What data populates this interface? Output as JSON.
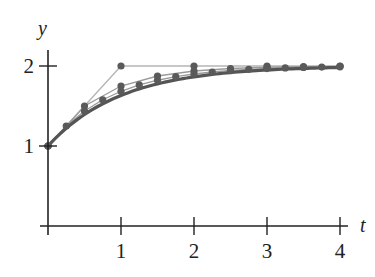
{
  "chart_data": {
    "type": "line",
    "title": "",
    "xlabel": "t",
    "ylabel": "y",
    "xlim": [
      0,
      4
    ],
    "ylim": [
      0,
      2
    ],
    "x_ticks": [
      1,
      2,
      3,
      4
    ],
    "y_ticks": [
      1,
      2
    ],
    "grid": false,
    "legend": null,
    "series": [
      {
        "name": "Euler h=1",
        "style": "thin light gray line with dots",
        "x": [
          0,
          1,
          2,
          3,
          4
        ],
        "values": [
          1,
          2,
          2,
          2,
          2
        ]
      },
      {
        "name": "Euler h=0.5",
        "style": "thin gray line with dots",
        "x": [
          0,
          0.5,
          1,
          1.5,
          2,
          2.5,
          3,
          3.5,
          4
        ],
        "values": [
          1,
          1.5,
          1.75,
          1.875,
          1.9375,
          1.96875,
          1.984375,
          1.9921875,
          1.99609375
        ]
      },
      {
        "name": "Euler h=0.25",
        "style": "thin gray line with dots",
        "x": [
          0,
          0.25,
          0.5,
          0.75,
          1,
          1.25,
          1.5,
          1.75,
          2,
          2.25,
          2.5,
          2.75,
          3,
          3.25,
          3.5,
          3.75,
          4
        ],
        "values": [
          1,
          1.25,
          1.4375,
          1.578,
          1.684,
          1.763,
          1.822,
          1.867,
          1.9,
          1.925,
          1.944,
          1.958,
          1.968,
          1.976,
          1.982,
          1.987,
          1.99
        ]
      },
      {
        "name": "Exact solution",
        "style": "thick dark curve",
        "x": [
          0,
          0.25,
          0.5,
          0.75,
          1,
          1.5,
          2,
          2.5,
          3,
          3.5,
          4
        ],
        "values": [
          1,
          1.221,
          1.393,
          1.528,
          1.632,
          1.777,
          1.865,
          1.918,
          1.95,
          1.97,
          1.982
        ]
      }
    ]
  },
  "axes": {
    "x_label": "t",
    "y_label": "y",
    "x_tick_labels": [
      "1",
      "2",
      "3",
      "4"
    ],
    "y_tick_labels": [
      "1",
      "2"
    ]
  },
  "colors": {
    "axis": "#222222",
    "exact": "#555555",
    "euler_light": "#b5b5b5",
    "euler_mid": "#9a9a9a",
    "dots": "#5a5a5a"
  }
}
